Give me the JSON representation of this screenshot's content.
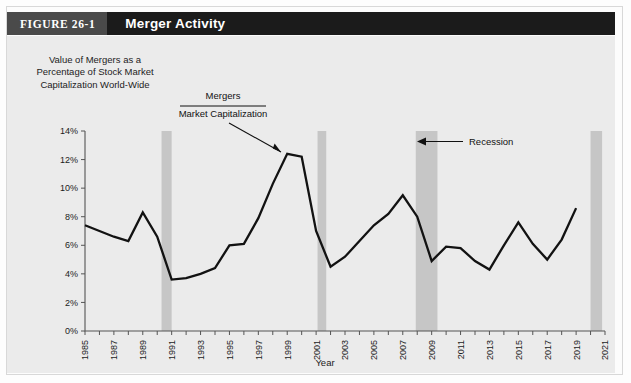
{
  "figure": {
    "number_label": "FIGURE 26-1",
    "title": "Merger Activity"
  },
  "colors": {
    "figure_number_bg": "#4a4a4a",
    "figure_title_bg": "#1b1b1b",
    "plot_bg": "#ebebeb",
    "recession_band": "#c6c6c6",
    "line": "#121212",
    "axis": "#555555"
  },
  "axis_title_y": "Value of Mergers as a Percentage of Stock Market Capitalization World-Wide",
  "annotations": {
    "series_numerator": "Mergers",
    "series_denominator": "Market Capitalization",
    "recession": "Recession"
  },
  "chart_data": {
    "type": "line",
    "title": "Merger Activity",
    "xlabel": "Year",
    "ylabel": "Value of Mergers as a Percentage of Stock Market Capitalization World-Wide",
    "xlim": [
      1985,
      2021
    ],
    "ylim": [
      0,
      14
    ],
    "grid": false,
    "legend_position": "none",
    "y_ticks": [
      0,
      2,
      4,
      6,
      8,
      10,
      12,
      14
    ],
    "y_tick_labels": [
      "0%",
      "2%",
      "4%",
      "6%",
      "8%",
      "10%",
      "12%",
      "14%"
    ],
    "x_ticks": [
      1985,
      1986,
      1987,
      1988,
      1989,
      1990,
      1991,
      1992,
      1993,
      1994,
      1995,
      1996,
      1997,
      1998,
      1999,
      2000,
      2001,
      2002,
      2003,
      2004,
      2005,
      2006,
      2007,
      2008,
      2009,
      2010,
      2011,
      2012,
      2013,
      2014,
      2015,
      2016,
      2017,
      2018,
      2019,
      2020,
      2021
    ],
    "x_tick_labels": [
      "1985",
      "1987",
      "1989",
      "1991",
      "1993",
      "1995",
      "1997",
      "1999",
      "2001",
      "2003",
      "2005",
      "2007",
      "2009",
      "2011",
      "2013",
      "2015",
      "2017",
      "2019",
      "2021"
    ],
    "x_tick_labels_years": [
      1985,
      1987,
      1989,
      1991,
      1993,
      1995,
      1997,
      1999,
      2001,
      2003,
      2005,
      2007,
      2009,
      2011,
      2013,
      2015,
      2017,
      2019,
      2021
    ],
    "series": [
      {
        "name": "Mergers / Market Capitalization",
        "x": [
          1985,
          1986,
          1987,
          1988,
          1989,
          1990,
          1991,
          1992,
          1993,
          1994,
          1995,
          1996,
          1997,
          1998,
          1999,
          2000,
          2001,
          2002,
          2003,
          2004,
          2005,
          2006,
          2007,
          2008,
          2009,
          2010,
          2011,
          2012,
          2013,
          2014,
          2015,
          2016,
          2017,
          2018,
          2019
        ],
        "values": [
          7.4,
          7.0,
          6.6,
          6.3,
          8.3,
          6.6,
          3.6,
          3.7,
          4.0,
          4.4,
          6.0,
          6.1,
          7.9,
          10.3,
          12.4,
          12.2,
          7.0,
          4.5,
          5.2,
          6.3,
          7.4,
          8.2,
          9.5,
          8.0,
          4.9,
          5.9,
          5.8,
          4.9,
          4.3,
          6.0,
          7.6,
          6.1,
          5.0,
          6.4,
          8.6
        ]
      }
    ],
    "recession_bands": [
      {
        "start": 1990.3,
        "end": 1991.0,
        "label": "Recession"
      },
      {
        "start": 2001.1,
        "end": 2001.7,
        "label": "Recession"
      },
      {
        "start": 2007.9,
        "end": 2009.4,
        "label": "Recession"
      },
      {
        "start": 2020.0,
        "end": 2020.8,
        "label": "Recession"
      }
    ]
  }
}
